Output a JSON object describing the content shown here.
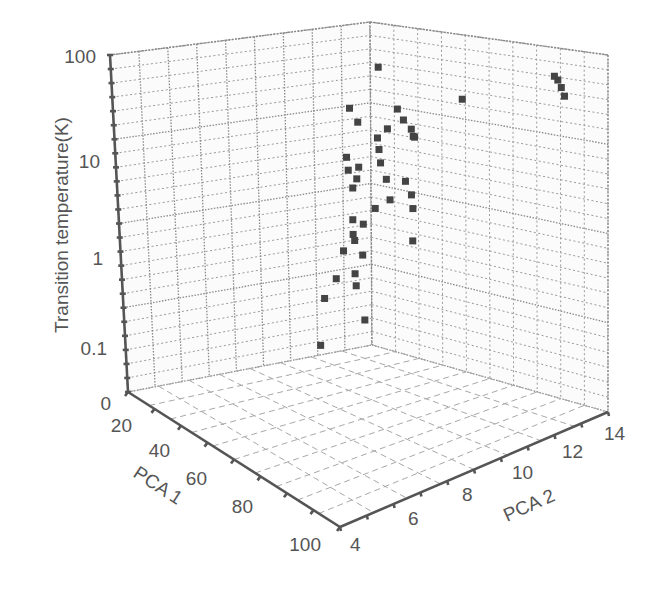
{
  "chart_data": {
    "type": "scatter3d",
    "title": "",
    "zlabel": "Transition temperature(K)",
    "xlabel": "PCA 1",
    "ylabel": "PCA 2",
    "z_scale": "log",
    "z_ticks": [
      "100",
      "10",
      "1",
      "0.1",
      "0"
    ],
    "x_ticks": [
      "20",
      "40",
      "60",
      "80",
      "100"
    ],
    "y_ticks": [
      "4",
      "6",
      "8",
      "10",
      "12",
      "14"
    ],
    "xlim": [
      20,
      100
    ],
    "ylim": [
      4,
      14
    ],
    "zlim": [
      0.01,
      100
    ],
    "grid": true,
    "legend": null,
    "points": [
      {
        "pca1": 30,
        "pca2": 13.5,
        "tc": 80
      },
      {
        "pca1": 28,
        "pca2": 13.2,
        "tc": 90
      },
      {
        "pca1": 25,
        "pca2": 12.8,
        "tc": 95
      },
      {
        "pca1": 22,
        "pca2": 12.4,
        "tc": 92
      },
      {
        "pca1": 35,
        "pca2": 9.5,
        "tc": 40
      },
      {
        "pca1": 30,
        "pca2": 5.5,
        "tc": 40
      },
      {
        "pca1": 45,
        "pca2": 7.5,
        "tc": 25
      },
      {
        "pca1": 48,
        "pca2": 8.0,
        "tc": 22
      },
      {
        "pca1": 50,
        "pca2": 8.5,
        "tc": 20
      },
      {
        "pca1": 52,
        "pca2": 8.8,
        "tc": 18
      },
      {
        "pca1": 55,
        "pca2": 9.0,
        "tc": 20
      },
      {
        "pca1": 47,
        "pca2": 7.2,
        "tc": 15
      },
      {
        "pca1": 50,
        "pca2": 7.0,
        "tc": 12
      },
      {
        "pca1": 53,
        "pca2": 7.3,
        "tc": 10
      },
      {
        "pca1": 56,
        "pca2": 7.6,
        "tc": 8
      },
      {
        "pca1": 58,
        "pca2": 8.0,
        "tc": 6
      },
      {
        "pca1": 60,
        "pca2": 8.3,
        "tc": 4
      },
      {
        "pca1": 62,
        "pca2": 7.8,
        "tc": 3
      },
      {
        "pca1": 65,
        "pca2": 7.5,
        "tc": 2
      },
      {
        "pca1": 67,
        "pca2": 7.2,
        "tc": 1.5
      },
      {
        "pca1": 70,
        "pca2": 7.0,
        "tc": 1
      },
      {
        "pca1": 72,
        "pca2": 6.8,
        "tc": 0.5
      },
      {
        "pca1": 75,
        "pca2": 6.5,
        "tc": 0.3
      },
      {
        "pca1": 78,
        "pca2": 6.5,
        "tc": 0.1
      },
      {
        "pca1": 40,
        "pca2": 5.0,
        "tc": 15
      },
      {
        "pca1": 42,
        "pca2": 5.5,
        "tc": 12
      },
      {
        "pca1": 30,
        "pca2": 4.5,
        "tc": 3
      },
      {
        "pca1": 35,
        "pca2": 4.8,
        "tc": 2.5
      },
      {
        "pca1": 45,
        "pca2": 5.2,
        "tc": 5
      },
      {
        "pca1": 48,
        "pca2": 5.5,
        "tc": 4
      },
      {
        "pca1": 52,
        "pca2": 6.0,
        "tc": 3
      },
      {
        "pca1": 55,
        "pca2": 6.2,
        "tc": 1.5
      },
      {
        "pca1": 58,
        "pca2": 6.5,
        "tc": 1
      },
      {
        "pca1": 60,
        "pca2": 7.0,
        "tc": 0.8
      },
      {
        "pca1": 62,
        "pca2": 6.8,
        "tc": 0.5
      },
      {
        "pca1": 64,
        "pca2": 7.0,
        "tc": 0.4
      },
      {
        "pca1": 66,
        "pca2": 7.5,
        "tc": 0.2
      },
      {
        "pca1": 54,
        "pca2": 8.5,
        "tc": 6
      },
      {
        "pca1": 57,
        "pca2": 9.0,
        "tc": 5
      },
      {
        "pca1": 60,
        "pca2": 9.3,
        "tc": 4
      },
      {
        "pca1": 63,
        "pca2": 9.5,
        "tc": 2
      }
    ]
  },
  "axes": {
    "z_title": "Transition temperature(K)",
    "x_title": "PCA 1",
    "y_title": "PCA 2"
  }
}
